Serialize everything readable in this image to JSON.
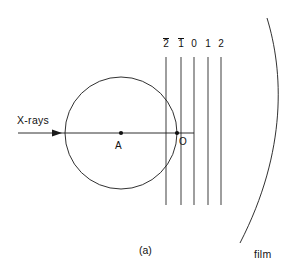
{
  "figure": {
    "caption": "(a)",
    "width": 294,
    "height": 279,
    "background": "#ffffff",
    "stroke_color": "#1a1a1a"
  },
  "labels": {
    "xrays": "X-rays",
    "crystal_center": "A",
    "origin": "O",
    "film": "film"
  },
  "layer_lines": {
    "values": [
      "2",
      "1",
      "0",
      "1",
      "2"
    ],
    "overbar": [
      true,
      true,
      false,
      false,
      false
    ],
    "x_positions": [
      166,
      181,
      194,
      208,
      221
    ],
    "y_top": 57,
    "y_bottom": 205
  },
  "label_positions": {
    "tick_y": 38,
    "xrays": {
      "x": 17,
      "y": 115
    },
    "crystal_center": {
      "x": 115,
      "y": 141
    },
    "origin": {
      "x": 179,
      "y": 137
    },
    "film": {
      "x": 254,
      "y": 249
    },
    "caption": {
      "x": 139,
      "y": 245
    }
  },
  "circle": {
    "center_x": 121,
    "center_y": 133,
    "radius": 56
  },
  "beam": {
    "x_start": 18,
    "x_end": 194,
    "y": 133,
    "arrow_tip_x": 62
  },
  "points": [
    {
      "name": "A",
      "x": 121,
      "y": 133
    },
    {
      "name": "O",
      "x": 177,
      "y": 133
    }
  ],
  "film_arc": {
    "start_x": 267,
    "start_y": 18,
    "end_x": 240,
    "end_y": 243,
    "bulge_x": 288
  }
}
